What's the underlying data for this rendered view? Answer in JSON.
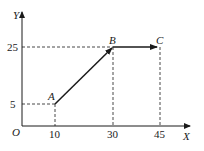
{
  "diagram": {
    "axes": {
      "x_label": "X",
      "y_label": "Y",
      "origin_label": "O"
    },
    "x_ticks": [
      "10",
      "30",
      "45"
    ],
    "y_ticks": [
      "5",
      "25"
    ],
    "points": [
      {
        "name": "A",
        "x": 10,
        "y": 5
      },
      {
        "name": "B",
        "x": 30,
        "y": 25
      },
      {
        "name": "C",
        "x": 45,
        "y": 25
      }
    ],
    "segments": [
      {
        "from": "A",
        "to": "B",
        "arrow": true
      },
      {
        "from": "B",
        "to": "C",
        "arrow": true
      }
    ]
  }
}
